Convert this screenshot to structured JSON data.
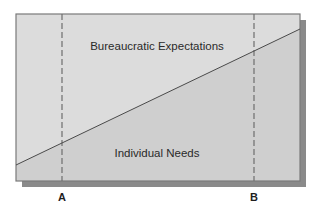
{
  "diagram": {
    "type": "area-division",
    "regions": {
      "upper": {
        "label": "Bureaucratic Expectations",
        "fill": "#dcdcdc"
      },
      "lower": {
        "label": "Individual Needs",
        "fill": "#cfcfcf"
      }
    },
    "markers": [
      {
        "label": "A"
      },
      {
        "label": "B"
      }
    ],
    "colors": {
      "border": "#7a7a7a",
      "shadow": "#8a8a8a",
      "divider_line": "#4a4a4a",
      "dashed_line": "#6e6e6e",
      "text": "#2a2a2a"
    }
  }
}
